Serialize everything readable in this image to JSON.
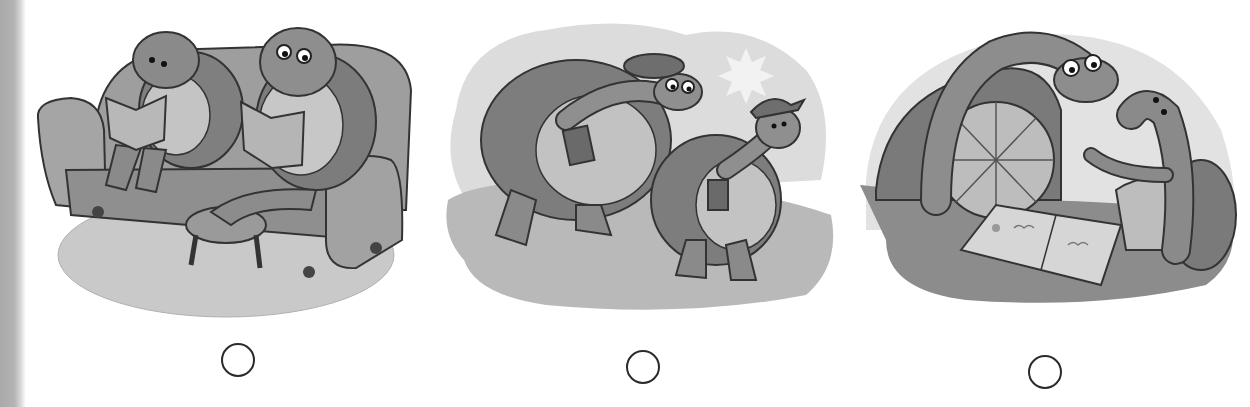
{
  "worksheet": {
    "type": "picture-choice",
    "instructions_visible": false,
    "colors": {
      "background": "#ffffff",
      "ink": "#2a2a2a",
      "binding_edge": "#b0b0b0",
      "fill_light": "#d9d9d9",
      "fill_mid": "#a8a8a8",
      "fill_dark": "#8a8a8a"
    },
    "options": [
      {
        "index": 1,
        "scene": "Two turtles reading books on a sofa; the older turtle with glasses rests its feet on a footstool, on a round rug",
        "answer_circle": {
          "filled": false
        }
      },
      {
        "index": 2,
        "scene": "Two turtles carrying books walking outdoors; the older one wears a beret and glasses, the younger one wears a cap; a sun is in the sky",
        "answer_circle": {
          "filled": false
        }
      },
      {
        "index": 3,
        "scene": "An older turtle with glasses and a younger turtle looking at an open picture book together at a table",
        "answer_circle": {
          "filled": false
        }
      }
    ]
  }
}
